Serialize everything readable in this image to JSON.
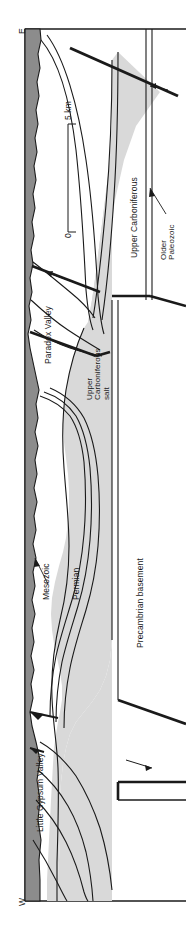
{
  "figure": {
    "orientation": "rotated",
    "colors": {
      "mesozoic_fill": "#8c8c8c",
      "salt_fill": "#d9d9d9",
      "background": "#ffffff",
      "line": "#1a1a1a"
    }
  },
  "compass": {
    "east_label": "E",
    "west_label": "W"
  },
  "scale_bar": {
    "top_label": "5 km",
    "bottom_label": "0",
    "units": "km",
    "max_value": 5,
    "min_value": 0
  },
  "units": [
    {
      "id": "mesozoic",
      "label": "Mesozoic",
      "has_leader": true
    },
    {
      "id": "permian",
      "label": "Permian",
      "has_leader": false
    },
    {
      "id": "upper-carboniferous",
      "label": "Upper Carboniferous",
      "has_leader": false
    },
    {
      "id": "upper-carboniferous-salt",
      "line1": "Upper",
      "line2": "Carboniferous",
      "line3": "salt",
      "has_leader": false
    },
    {
      "id": "older-paleozoic",
      "line1": "Older",
      "line2": "Paleozoic",
      "has_leader": true
    },
    {
      "id": "precambrian-basement",
      "label": "Precambrian basement",
      "has_leader": false
    }
  ],
  "valleys": [
    {
      "id": "paradox-valley",
      "label": "Paradox Valley"
    },
    {
      "id": "little-gypsum-valley",
      "label": "Little Gypsum Valley"
    }
  ]
}
